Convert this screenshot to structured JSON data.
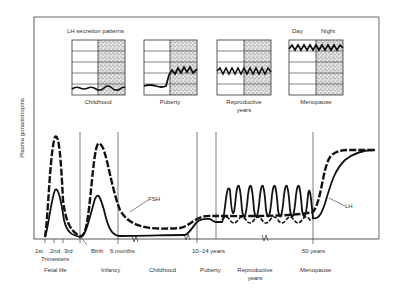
{
  "figure": {
    "y_axis_label": "Plasma gonadotropins",
    "inset_title": "LH secretion patterns",
    "inset_day_label": "Day",
    "inset_night_label": "Night",
    "insets": [
      {
        "label": "Childhood",
        "label2": ""
      },
      {
        "label": "Puberty",
        "label2": ""
      },
      {
        "label": "Reproductive",
        "label2": "years"
      },
      {
        "label": "Menopause",
        "label2": ""
      }
    ],
    "curve_labels": {
      "fsh": "FSH",
      "lh": "LH"
    },
    "x_ticks": {
      "t1": "1st",
      "t2": "2nd",
      "t3": "3rd",
      "trimesters": "Trimesters",
      "birth": "Birth",
      "six_months": "6 months",
      "puberty_age": "10–14 years",
      "fifty": "50 years"
    },
    "phases": {
      "fetal": "Fetal life",
      "infancy": "Infancy",
      "childhood": "Childhood",
      "puberty": "Puberty",
      "reproductive": "Reproductive",
      "reproductive2": "years",
      "menopause": "Menopause"
    }
  }
}
